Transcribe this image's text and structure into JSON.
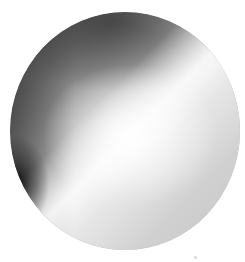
{
  "image": {
    "subject": "gray-shaded-sphere",
    "colors": {
      "background": "#ffffff",
      "shadow": "#4a4a4a",
      "midtone": "#b5b5b5",
      "highlight": "#ffffff",
      "dark_edge": "#1a1a1a"
    }
  }
}
